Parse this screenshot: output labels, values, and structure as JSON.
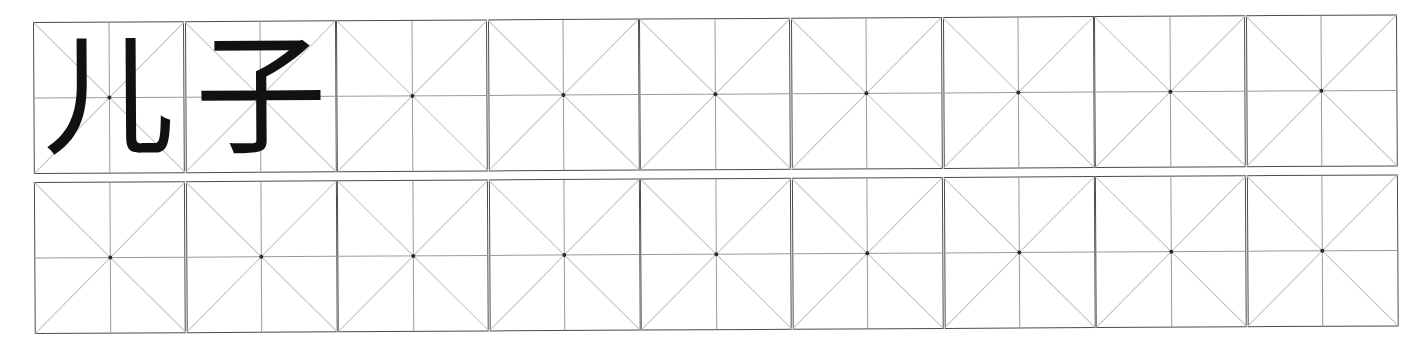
{
  "worksheet": {
    "type": "chinese-character-practice-grid",
    "grid_style": "mizige",
    "columns": 9,
    "rows": 2,
    "word": "儿子",
    "pinyin": "",
    "background_color": "#ffffff",
    "cell_border_color": "#4d4d4d",
    "cross_line_color": "#9b9b9b",
    "diagonal_line_color": "#c2c2c2",
    "center_dot_color": "#2b2b2b",
    "glyph_color": "#111111",
    "rows_data": [
      {
        "row_index": 1,
        "cells": [
          {
            "character": "儿",
            "filled": true
          },
          {
            "character": "子",
            "filled": true
          },
          {
            "character": "",
            "filled": false
          },
          {
            "character": "",
            "filled": false
          },
          {
            "character": "",
            "filled": false
          },
          {
            "character": "",
            "filled": false
          },
          {
            "character": "",
            "filled": false
          },
          {
            "character": "",
            "filled": false
          },
          {
            "character": "",
            "filled": false
          }
        ]
      },
      {
        "row_index": 2,
        "cells": [
          {
            "character": "",
            "filled": false
          },
          {
            "character": "",
            "filled": false
          },
          {
            "character": "",
            "filled": false
          },
          {
            "character": "",
            "filled": false
          },
          {
            "character": "",
            "filled": false
          },
          {
            "character": "",
            "filled": false
          },
          {
            "character": "",
            "filled": false
          },
          {
            "character": "",
            "filled": false
          },
          {
            "character": "",
            "filled": false
          }
        ]
      }
    ]
  }
}
